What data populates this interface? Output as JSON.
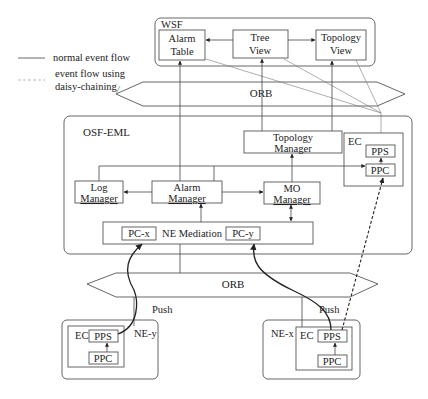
{
  "legend": {
    "normal": "normal event flow",
    "daisy_line1": "event flow using",
    "daisy_line2": "daisy-chaining"
  },
  "wsf": {
    "title": "WSF",
    "alarm_table": [
      "Alarm",
      "Table"
    ],
    "tree_view": [
      "Tree",
      "View"
    ],
    "topology_view": [
      "Topology",
      "View"
    ]
  },
  "orb_top": {
    "label": "ORB"
  },
  "osf": {
    "title": "OSF-EML",
    "topology_manager": [
      "Topology",
      "Manager"
    ],
    "ec": {
      "title": "EC",
      "pps": "PPS",
      "ppc": "PPC"
    },
    "log_manager": [
      "Log",
      "Manager"
    ],
    "alarm_manager": [
      "Alarm",
      "Manager"
    ],
    "mo_manager": [
      "MO",
      "Manager"
    ],
    "ne_mediation": {
      "label": "NE Mediation",
      "pc_x": "PC-x",
      "pc_y": "PC-y"
    }
  },
  "orb_bottom": {
    "label": "ORB"
  },
  "push_labels": {
    "left": "Push",
    "right": "Push"
  },
  "ne_y": {
    "title": "NE-y",
    "ec": "EC",
    "pps": "PPS",
    "ppc": "PPC"
  },
  "ne_x": {
    "title": "NE-x",
    "ec": "EC",
    "pps": "PPS",
    "ppc": "PPC"
  }
}
